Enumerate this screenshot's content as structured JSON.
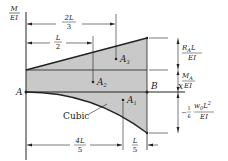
{
  "axis": {
    "y_label_num": "M",
    "y_label_den": "EI",
    "x_label": "x"
  },
  "points": {
    "A": "A",
    "B": "B"
  },
  "areas": {
    "A1": {
      "base": "A",
      "sub": "1"
    },
    "A2": {
      "base": "A",
      "sub": "2"
    },
    "A3": {
      "base": "A",
      "sub": "3"
    }
  },
  "curve_label": "Cubic",
  "dimensions": {
    "two_L_over_3": {
      "num": "2L",
      "den": "3"
    },
    "L_over_2": {
      "num": "L",
      "den": "2"
    },
    "four_L_over_5": {
      "num": "4L",
      "den": "5"
    },
    "L_over_5": {
      "num": "L",
      "den": "5"
    }
  },
  "right_labels": {
    "RAL_EI": {
      "num_R": "R",
      "num_sub": "A",
      "num_L": "L",
      "den": "EI"
    },
    "MA_EI": {
      "num_M": "M",
      "num_sub": "A",
      "den": "EI"
    },
    "neg_w0L2": {
      "prefix": "−",
      "frac_num": "1",
      "frac_den": "6",
      "num_w": "w",
      "num_sub": "0",
      "num_L": "L",
      "num_sup": "2",
      "den": "EI"
    }
  },
  "colors": {
    "shade": "#c9c9c9",
    "line": "#222222",
    "background": "#ffffff"
  }
}
